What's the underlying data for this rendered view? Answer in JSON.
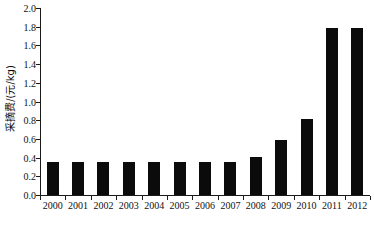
{
  "chart_data": {
    "type": "bar",
    "title": "",
    "xlabel": "",
    "ylabel": "采摘费/(元/kg)",
    "categories": [
      "2000",
      "2001",
      "2002",
      "2003",
      "2004",
      "2005",
      "2006",
      "2007",
      "2008",
      "2009",
      "2010",
      "2011",
      "2012"
    ],
    "values": [
      0.35,
      0.35,
      0.35,
      0.35,
      0.35,
      0.35,
      0.35,
      0.35,
      0.41,
      0.59,
      0.81,
      1.79,
      1.79
    ],
    "series": [
      {
        "name": "采摘费",
        "values": [
          0.35,
          0.35,
          0.35,
          0.35,
          0.35,
          0.35,
          0.35,
          0.35,
          0.41,
          0.59,
          0.81,
          1.79,
          1.79
        ]
      }
    ],
    "ylim": [
      0.0,
      2.0
    ],
    "ytick_values": [
      0.0,
      0.2,
      0.4,
      0.6,
      0.8,
      1.0,
      1.2,
      1.4,
      1.6,
      1.8,
      2.0
    ],
    "ytick_labels": [
      "0.0",
      "0.2",
      "0.4",
      "0.6",
      "0.8",
      "1.0",
      "1.2",
      "1.4",
      "1.6",
      "1.8",
      "2.0"
    ],
    "grid": false,
    "legend": false,
    "legend_position": "none",
    "bar_color": "#0b0b0b",
    "axis_color": "#1a1a1a",
    "background_color": "#ffffff",
    "spines": [
      "left",
      "bottom"
    ],
    "tick_direction": "out"
  }
}
